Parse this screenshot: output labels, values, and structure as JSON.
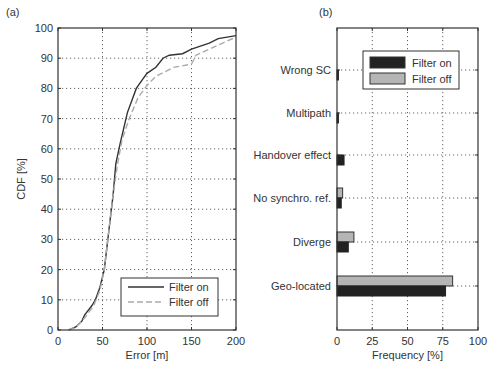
{
  "chart_data": [
    {
      "panel_label": "(a)",
      "type": "line",
      "title": "",
      "xlabel": "Error [m]",
      "ylabel": "CDF [%]",
      "xlim": [
        0,
        200
      ],
      "ylim": [
        0,
        100
      ],
      "xticks": [
        0,
        50,
        100,
        150,
        200
      ],
      "yticks": [
        0,
        10,
        20,
        30,
        40,
        50,
        60,
        70,
        80,
        90,
        100
      ],
      "grid": true,
      "legend_position": "lower right",
      "series": [
        {
          "name": "Filter on",
          "style": "solid",
          "color": "#333333",
          "x": [
            12,
            20,
            27,
            30,
            38,
            42,
            47,
            52,
            58,
            62,
            65,
            70,
            78,
            88,
            95,
            100,
            110,
            118,
            125,
            140,
            150,
            160,
            170,
            180,
            200
          ],
          "y": [
            0,
            1,
            3,
            5,
            8,
            10,
            14,
            20,
            35,
            45,
            55,
            62,
            72,
            80,
            83,
            85,
            87,
            90,
            91,
            91.5,
            93,
            94,
            95,
            96.5,
            97.5
          ]
        },
        {
          "name": "Filter off",
          "style": "dashed",
          "color": "#aaaaaa",
          "x": [
            12,
            20,
            30,
            40,
            47,
            52,
            58,
            62,
            67,
            72,
            80,
            90,
            100,
            110,
            130,
            150,
            155,
            170,
            185,
            200
          ],
          "y": [
            0,
            1,
            4,
            8,
            13,
            20,
            35,
            45,
            55,
            63,
            70,
            77,
            81,
            84,
            87,
            88,
            91,
            93,
            95,
            97
          ]
        }
      ]
    },
    {
      "panel_label": "(b)",
      "type": "bar",
      "orientation": "horizontal",
      "title": "",
      "xlabel": "Frequency [%]",
      "ylabel": "",
      "xlim": [
        0,
        100
      ],
      "xticks": [
        0,
        25,
        50,
        75,
        100
      ],
      "grid": true,
      "legend_position": "upper right",
      "categories": [
        "Wrong SC",
        "Multipath",
        "Handover effect",
        "No synchro. ref.",
        "Diverge",
        "Geo-located"
      ],
      "series": [
        {
          "name": "Filter on",
          "color": "#222222",
          "values": [
            1,
            1,
            5,
            3,
            8,
            77
          ]
        },
        {
          "name": "Filter off",
          "color": "#b5b5b5",
          "values": [
            0,
            0,
            0,
            4,
            12,
            82
          ]
        }
      ]
    }
  ]
}
